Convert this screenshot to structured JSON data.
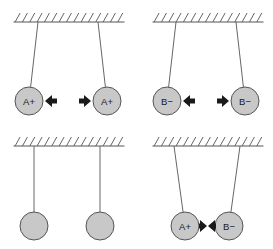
{
  "figure": {
    "width": 273,
    "height": 249,
    "background_color": "#ffffff",
    "panel_count": 4
  },
  "style": {
    "ball_fill": "#c8c8c8",
    "ball_stroke": "#555555",
    "string_stroke": "#555555",
    "ceiling_stroke": "#555555",
    "arrow_fill": "#1a1a1a",
    "label_color": "#1a1a1a",
    "ball_radius": 14,
    "string_width": 0.9,
    "ceiling_width": 1.0
  },
  "panels": [
    {
      "id": "panel-top-left",
      "name": "two-positive-charges-repelling",
      "position": "top-left",
      "ceiling": {
        "x1": 14,
        "x2": 124,
        "y": 22,
        "hatch_count": 15,
        "hatch_length": 9,
        "hatch_slant": 5
      },
      "balls": [
        {
          "name": "ball-left",
          "label": "A+",
          "charge": "positive",
          "cx": 29,
          "cy": 101,
          "anchor_x": 38,
          "labeled": true
        },
        {
          "name": "ball-right",
          "label": "A+",
          "charge": "positive",
          "cx": 107,
          "cy": 101,
          "anchor_x": 98,
          "labeled": true
        }
      ],
      "arrows": [
        {
          "name": "arrow-left-ball-force",
          "direction": "left",
          "tip_x": 45,
          "tail_x": 57,
          "y": 101
        },
        {
          "name": "arrow-right-ball-force",
          "direction": "right",
          "tip_x": 91,
          "tail_x": 79,
          "y": 101
        }
      ]
    },
    {
      "id": "panel-top-right",
      "name": "two-negative-charges-repelling",
      "position": "top-right",
      "ceiling": {
        "x1": 153,
        "x2": 263,
        "y": 22,
        "hatch_count": 15,
        "hatch_length": 9,
        "hatch_slant": 5
      },
      "balls": [
        {
          "name": "ball-left",
          "label": "B−",
          "charge": "negative",
          "cx": 167,
          "cy": 101,
          "anchor_x": 176,
          "labeled": true
        },
        {
          "name": "ball-right",
          "label": "B−",
          "charge": "negative",
          "cx": 245,
          "cy": 101,
          "anchor_x": 236,
          "labeled": true
        }
      ],
      "arrows": [
        {
          "name": "arrow-left-ball-force",
          "direction": "left",
          "tip_x": 183,
          "tail_x": 195,
          "y": 101
        },
        {
          "name": "arrow-right-ball-force",
          "direction": "right",
          "tip_x": 229,
          "tail_x": 217,
          "y": 101
        }
      ]
    },
    {
      "id": "panel-bottom-left",
      "name": "two-neutral-charges-at-rest",
      "position": "bottom-left",
      "ceiling": {
        "x1": 14,
        "x2": 124,
        "y": 146,
        "hatch_count": 15,
        "hatch_length": 9,
        "hatch_slant": 5
      },
      "balls": [
        {
          "name": "ball-left",
          "label": "",
          "charge": "neutral",
          "cx": 34,
          "cy": 226,
          "anchor_x": 34,
          "labeled": false
        },
        {
          "name": "ball-right",
          "label": "",
          "charge": "neutral",
          "cx": 100,
          "cy": 226,
          "anchor_x": 100,
          "labeled": false
        }
      ],
      "arrows": []
    },
    {
      "id": "panel-bottom-right",
      "name": "opposite-charges-attracting",
      "position": "bottom-right",
      "ceiling": {
        "x1": 153,
        "x2": 263,
        "y": 146,
        "hatch_count": 15,
        "hatch_length": 9,
        "hatch_slant": 5
      },
      "balls": [
        {
          "name": "ball-left",
          "label": "A+",
          "charge": "positive",
          "cx": 185,
          "cy": 226,
          "anchor_x": 174,
          "labeled": true
        },
        {
          "name": "ball-right",
          "label": "B−",
          "charge": "negative",
          "cx": 229,
          "cy": 226,
          "anchor_x": 240,
          "labeled": true
        }
      ],
      "arrows": [
        {
          "name": "arrow-left-ball-force",
          "direction": "right",
          "tip_x": 207,
          "tail_x": 199,
          "y": 226
        },
        {
          "name": "arrow-right-ball-force",
          "direction": "left",
          "tip_x": 208,
          "tail_x": 216,
          "y": 226
        }
      ]
    }
  ]
}
